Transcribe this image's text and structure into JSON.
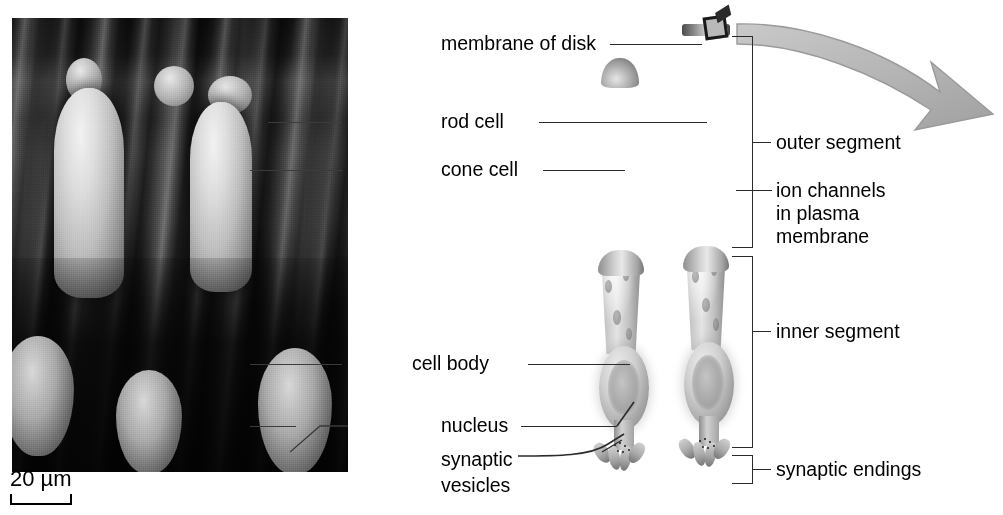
{
  "figure": {
    "type": "labeled-biology-diagram"
  },
  "micrograph": {
    "name": "scanning electron micrograph of retinal photoreceptors",
    "scale_bar": {
      "label": "20 µm",
      "value": 20,
      "unit": "µm"
    }
  },
  "labels": {
    "membrane_of_disk": "membrane of disk",
    "rod_cell": "rod cell",
    "cone_cell": "cone cell",
    "cell_body": "cell body",
    "nucleus": "nucleus",
    "synaptic_vesicles_line1": "synaptic",
    "synaptic_vesicles_line2": "vesicles",
    "outer_segment": "outer segment",
    "ion_channels_line1": "ion channels",
    "ion_channels_line2": "in plasma",
    "ion_channels_line3": "membrane",
    "inner_segment": "inner segment",
    "synaptic_endings": "synaptic endings"
  },
  "colors": {
    "background": "#ffffff",
    "text": "#000000",
    "leader_line": "#2b2b2b",
    "arrow_fill": "#b8b8b8",
    "arrow_stroke": "#9a9a9a"
  },
  "icons": {
    "zoom_arrow": "curved-arrow-icon",
    "disk_membrane": "membrane-disk-icon"
  }
}
